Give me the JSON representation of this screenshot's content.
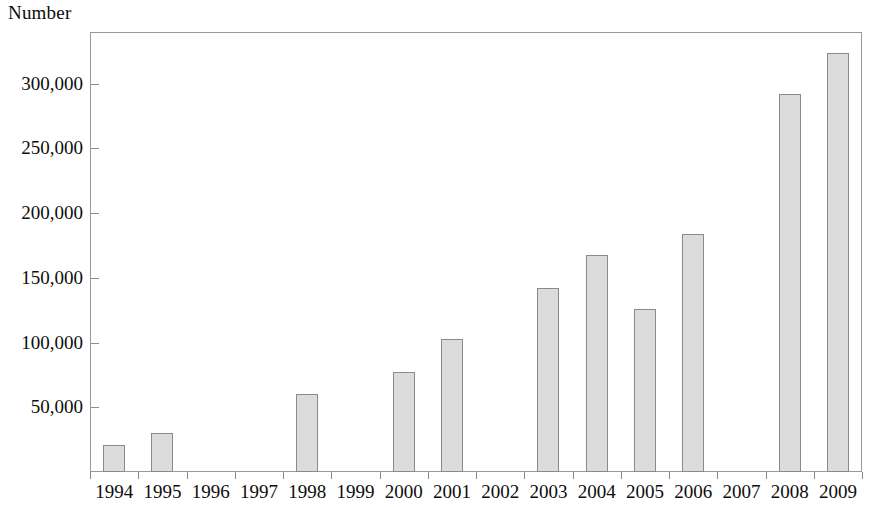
{
  "chart_data": {
    "type": "bar",
    "title": "",
    "ylabel": "Number",
    "xlabel": "",
    "categories": [
      "1994",
      "1995",
      "1996",
      "1997",
      "1998",
      "1999",
      "2000",
      "2001",
      "2002",
      "2003",
      "2004",
      "2005",
      "2006",
      "2007",
      "2008",
      "2009"
    ],
    "values": [
      21000,
      30000,
      null,
      null,
      60000,
      null,
      77000,
      103000,
      null,
      142000,
      168000,
      126000,
      184000,
      null,
      292000,
      324000
    ],
    "ylim": [
      0,
      340000
    ],
    "y_ticks": [
      50000,
      100000,
      150000,
      200000,
      250000,
      300000
    ],
    "y_tick_labels": [
      "50,000",
      "100,000",
      "150,000",
      "200,000",
      "250,000",
      "300,000"
    ],
    "grid": false,
    "legend": null,
    "series": [
      {
        "name": "Number",
        "values": [
          21000,
          30000,
          null,
          null,
          60000,
          null,
          77000,
          103000,
          null,
          142000,
          168000,
          126000,
          184000,
          null,
          292000,
          324000
        ]
      }
    ],
    "bar_fill_color": "#dcdcdc",
    "bar_border_color": "#8a8a8a",
    "frame_color": "#9a9a9a",
    "background_color": "#ffffff"
  }
}
